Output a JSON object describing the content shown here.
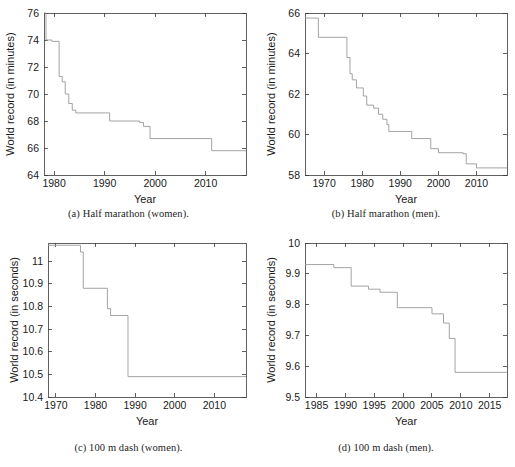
{
  "figure": {
    "panels": [
      {
        "id": "a",
        "caption": "(a) Half marathon (women).",
        "chart_key": 0
      },
      {
        "id": "b",
        "caption": "(b) Half marathon (men).",
        "chart_key": 1
      },
      {
        "id": "c",
        "caption": "(c) 100 m dash (women).",
        "chart_key": 2
      },
      {
        "id": "d",
        "caption": "(d) 100 m dash (men).",
        "chart_key": 3
      }
    ]
  },
  "chart_data": [
    {
      "type": "line",
      "subtype": "step",
      "title": "(a) Half marathon (women).",
      "xlabel": "Year",
      "ylabel": "World record (in minutes)",
      "xlim": [
        1978,
        2018
      ],
      "ylim": [
        64,
        76
      ],
      "xticks": [
        1980,
        1990,
        2000,
        2010
      ],
      "yticks": [
        64,
        66,
        68,
        70,
        72,
        74,
        76
      ],
      "grid": false,
      "legend": null,
      "line_color": "#9a9a9a",
      "x": [
        1978.0,
        1978.4,
        1979.6,
        1981.0,
        1981.6,
        1982.2,
        1982.9,
        1983.6,
        1984.3,
        1991.0,
        1996.9,
        1997.7,
        1999.0,
        2006.9,
        2011.2,
        2018.0
      ],
      "y": [
        76.0,
        74.0,
        73.9,
        71.3,
        70.9,
        70.0,
        69.3,
        68.8,
        68.6,
        68.0,
        67.9,
        67.6,
        66.7,
        66.7,
        65.8,
        65.8
      ],
      "series": [
        {
          "name": "World record (half marathon, women)",
          "points": [
            {
              "year": 1978.0,
              "value": 76.0
            },
            {
              "year": 1978.4,
              "value": 74.0
            },
            {
              "year": 1979.6,
              "value": 73.9
            },
            {
              "year": 1981.0,
              "value": 71.3
            },
            {
              "year": 1981.6,
              "value": 70.9
            },
            {
              "year": 1982.2,
              "value": 70.0
            },
            {
              "year": 1982.9,
              "value": 69.3
            },
            {
              "year": 1983.6,
              "value": 68.8
            },
            {
              "year": 1984.3,
              "value": 68.6
            },
            {
              "year": 1991.0,
              "value": 68.0
            },
            {
              "year": 1996.9,
              "value": 67.9
            },
            {
              "year": 1997.7,
              "value": 67.6
            },
            {
              "year": 1999.0,
              "value": 66.7
            },
            {
              "year": 2006.9,
              "value": 66.7
            },
            {
              "year": 2011.2,
              "value": 65.8
            },
            {
              "year": 2018.0,
              "value": 65.8
            }
          ]
        }
      ]
    },
    {
      "type": "line",
      "subtype": "step",
      "title": "(b) Half marathon (men).",
      "xlabel": "Year",
      "ylabel": "World record (in minutes)",
      "xlim": [
        1965,
        2018
      ],
      "ylim": [
        58,
        66
      ],
      "xticks": [
        1970,
        1980,
        1990,
        2000,
        2010
      ],
      "yticks": [
        58,
        60,
        62,
        64,
        66
      ],
      "grid": false,
      "legend": null,
      "line_color": "#9a9a9a",
      "x": [
        1965.0,
        1968.5,
        1976.0,
        1976.8,
        1977.4,
        1978.5,
        1980.3,
        1981.2,
        1983.0,
        1984.3,
        1985.4,
        1986.5,
        1987.0,
        1993.0,
        1998.0,
        2000.0,
        2006.5,
        2007.3,
        2010.0,
        2018.0
      ],
      "y": [
        65.75,
        64.8,
        63.8,
        63.0,
        62.7,
        62.3,
        61.9,
        61.45,
        61.3,
        61.0,
        60.75,
        60.5,
        60.15,
        59.8,
        59.3,
        59.1,
        59.05,
        58.55,
        58.35,
        58.35
      ],
      "series": [
        {
          "name": "World record (half marathon, men)",
          "points": [
            {
              "year": 1965.0,
              "value": 65.75
            },
            {
              "year": 1968.5,
              "value": 64.8
            },
            {
              "year": 1976.0,
              "value": 63.8
            },
            {
              "year": 1976.8,
              "value": 63.0
            },
            {
              "year": 1977.4,
              "value": 62.7
            },
            {
              "year": 1978.5,
              "value": 62.3
            },
            {
              "year": 1980.3,
              "value": 61.9
            },
            {
              "year": 1981.2,
              "value": 61.45
            },
            {
              "year": 1983.0,
              "value": 61.3
            },
            {
              "year": 1984.3,
              "value": 61.0
            },
            {
              "year": 1985.4,
              "value": 60.75
            },
            {
              "year": 1986.5,
              "value": 60.5
            },
            {
              "year": 1987.0,
              "value": 60.15
            },
            {
              "year": 1993.0,
              "value": 59.8
            },
            {
              "year": 1998.0,
              "value": 59.3
            },
            {
              "year": 2000.0,
              "value": 59.1
            },
            {
              "year": 2006.5,
              "value": 59.05
            },
            {
              "year": 2007.3,
              "value": 58.55
            },
            {
              "year": 2010.0,
              "value": 58.35
            },
            {
              "year": 2018.0,
              "value": 58.35
            }
          ]
        }
      ]
    },
    {
      "type": "line",
      "subtype": "step",
      "title": "(c) 100 m dash (women).",
      "xlabel": "Year",
      "ylabel": "World record (in seconds)",
      "xlim": [
        1968,
        2018
      ],
      "ylim": [
        10.4,
        11.08
      ],
      "xticks": [
        1970,
        1980,
        1990,
        2000,
        2010
      ],
      "yticks": [
        10.4,
        10.5,
        10.6,
        10.7,
        10.8,
        10.9,
        11
      ],
      "ytick_labels": [
        "10.4",
        "10.5",
        "10.6",
        "10.7",
        "10.8",
        "10.9",
        "11"
      ],
      "grid": false,
      "legend": null,
      "line_color": "#9a9a9a",
      "x": [
        1968.0,
        1976.2,
        1976.9,
        1983.0,
        1983.8,
        1988.2,
        2018.0
      ],
      "y": [
        11.07,
        11.04,
        10.88,
        10.79,
        10.76,
        10.49,
        10.49
      ],
      "series": [
        {
          "name": "World record (100 m dash, women)",
          "points": [
            {
              "year": 1968.0,
              "value": 11.07
            },
            {
              "year": 1976.2,
              "value": 11.04
            },
            {
              "year": 1976.9,
              "value": 10.88
            },
            {
              "year": 1983.0,
              "value": 10.79
            },
            {
              "year": 1983.8,
              "value": 10.76
            },
            {
              "year": 1988.2,
              "value": 10.49
            },
            {
              "year": 2018.0,
              "value": 10.49
            }
          ]
        }
      ]
    },
    {
      "type": "line",
      "subtype": "step",
      "title": "(d) 100 m dash (men).",
      "xlabel": "Year",
      "ylabel": "World record (in seconds)",
      "xlim": [
        1983,
        2018
      ],
      "ylim": [
        9.5,
        10.0
      ],
      "xticks": [
        1985,
        1990,
        1995,
        2000,
        2005,
        2010,
        2015
      ],
      "yticks": [
        9.5,
        9.6,
        9.7,
        9.8,
        9.9,
        10
      ],
      "ytick_labels": [
        "9.5",
        "9.6",
        "9.7",
        "9.8",
        "9.9",
        "10"
      ],
      "grid": false,
      "legend": null,
      "line_color": "#9a9a9a",
      "x": [
        1983.0,
        1988.0,
        1991.0,
        1994.0,
        1996.0,
        1999.0,
        2005.0,
        2007.0,
        2008.0,
        2009.0,
        2018.0
      ],
      "y": [
        9.93,
        9.92,
        9.86,
        9.85,
        9.84,
        9.79,
        9.77,
        9.74,
        9.69,
        9.58,
        9.58
      ],
      "series": [
        {
          "name": "World record (100 m dash, men)",
          "points": [
            {
              "year": 1983.0,
              "value": 9.93
            },
            {
              "year": 1988.0,
              "value": 9.92
            },
            {
              "year": 1991.0,
              "value": 9.86
            },
            {
              "year": 1994.0,
              "value": 9.85
            },
            {
              "year": 1996.0,
              "value": 9.84
            },
            {
              "year": 1999.0,
              "value": 9.79
            },
            {
              "year": 2005.0,
              "value": 9.77
            },
            {
              "year": 2007.0,
              "value": 9.74
            },
            {
              "year": 2008.0,
              "value": 9.69
            },
            {
              "year": 2009.0,
              "value": 9.58
            },
            {
              "year": 2018.0,
              "value": 9.58
            }
          ]
        }
      ]
    }
  ],
  "geometry": {
    "panel_a": {
      "w": 257,
      "h": 230,
      "left": 44,
      "top": 13,
      "right": 246,
      "bottom": 175
    },
    "panel_b": {
      "w": 258,
      "h": 230,
      "left": 48,
      "top": 13,
      "right": 250,
      "bottom": 175
    },
    "panel_c": {
      "w": 257,
      "h": 237,
      "left": 48,
      "top": 13,
      "right": 246,
      "bottom": 167
    },
    "panel_d": {
      "w": 258,
      "h": 237,
      "left": 48,
      "top": 13,
      "right": 250,
      "bottom": 167
    }
  }
}
